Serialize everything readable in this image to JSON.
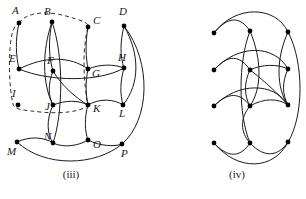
{
  "figure": {
    "background": "#ffffff",
    "stroke": "#1a1a1a",
    "vertex_fill": "#000000",
    "width": 306,
    "height": 199
  },
  "panels": [
    {
      "id": "iii",
      "caption": "(iii)",
      "caption_x": 70,
      "caption_y": 170,
      "labelled": true,
      "has_dashed_overlay": true,
      "vertices": [
        {
          "id": "A",
          "label": "A",
          "x": 19,
          "y": 23,
          "lx": 12,
          "ly": 14
        },
        {
          "id": "B",
          "label": "B",
          "x": 52,
          "y": 22,
          "lx": 44,
          "ly": 15
        },
        {
          "id": "C",
          "label": "C",
          "x": 88,
          "y": 27,
          "lx": 93,
          "ly": 24
        },
        {
          "id": "D",
          "label": "D",
          "x": 124,
          "y": 26,
          "lx": 119,
          "ly": 15
        },
        {
          "id": "E",
          "label": "E",
          "x": 19,
          "y": 69,
          "lx": 9,
          "ly": 62
        },
        {
          "id": "F",
          "label": "F",
          "x": 53,
          "y": 71,
          "lx": 47,
          "ly": 64
        },
        {
          "id": "G",
          "label": "G",
          "x": 88,
          "y": 69,
          "lx": 92,
          "ly": 77
        },
        {
          "id": "H",
          "label": "H",
          "x": 124,
          "y": 68,
          "lx": 118,
          "ly": 61
        },
        {
          "id": "I",
          "label": "I",
          "x": 18,
          "y": 105,
          "lx": 12,
          "ly": 97
        },
        {
          "id": "J",
          "label": "J",
          "x": 53,
          "y": 105,
          "lx": 45,
          "ly": 110
        },
        {
          "id": "K",
          "label": "K",
          "x": 88,
          "y": 105,
          "lx": 93,
          "ly": 112
        },
        {
          "id": "L",
          "label": "L",
          "x": 123,
          "y": 105,
          "lx": 119,
          "ly": 117
        },
        {
          "id": "M",
          "label": "M",
          "x": 17,
          "y": 142,
          "lx": 7,
          "ly": 155
        },
        {
          "id": "N",
          "label": "N",
          "x": 53,
          "y": 143,
          "lx": 44,
          "ly": 140
        },
        {
          "id": "O",
          "label": "O",
          "x": 88,
          "y": 140,
          "lx": 93,
          "ly": 148
        },
        {
          "id": "P",
          "label": "P",
          "x": 122,
          "y": 144,
          "lx": 121,
          "ly": 157
        }
      ],
      "edges": [
        {
          "from": "A",
          "to": "E"
        },
        {
          "from": "B",
          "to": "F"
        },
        {
          "from": "B",
          "to": "N"
        },
        {
          "from": "B",
          "to": "J"
        },
        {
          "from": "C",
          "to": "G"
        },
        {
          "from": "D",
          "to": "H"
        },
        {
          "from": "D",
          "to": "P"
        },
        {
          "from": "D",
          "to": "L"
        },
        {
          "from": "E",
          "to": "G"
        },
        {
          "from": "E",
          "to": "H"
        },
        {
          "from": "F",
          "to": "J"
        },
        {
          "from": "F",
          "to": "K"
        },
        {
          "from": "G",
          "to": "K"
        },
        {
          "from": "G",
          "to": "H"
        },
        {
          "from": "H",
          "to": "L"
        },
        {
          "from": "J",
          "to": "N"
        },
        {
          "from": "J",
          "to": "K"
        },
        {
          "from": "K",
          "to": "L"
        },
        {
          "from": "K",
          "to": "O"
        },
        {
          "from": "M",
          "to": "N"
        },
        {
          "from": "M",
          "to": "O"
        },
        {
          "from": "N",
          "to": "O"
        },
        {
          "from": "O",
          "to": "P"
        },
        {
          "from": "M",
          "to": "P"
        }
      ]
    },
    {
      "id": "iv",
      "caption": "(iv)",
      "caption_x": 236,
      "caption_y": 170,
      "labelled": false,
      "has_dashed_overlay": false,
      "vertices": [
        {
          "id": "a",
          "x": 214,
          "y": 33
        },
        {
          "id": "b",
          "x": 250,
          "y": 31
        },
        {
          "id": "c",
          "x": 288,
          "y": 32
        },
        {
          "id": "d",
          "x": 214,
          "y": 70
        },
        {
          "id": "e",
          "x": 250,
          "y": 70
        },
        {
          "id": "f",
          "x": 288,
          "y": 69
        },
        {
          "id": "g",
          "x": 214,
          "y": 106
        },
        {
          "id": "h",
          "x": 250,
          "y": 106
        },
        {
          "id": "i",
          "x": 288,
          "y": 105
        },
        {
          "id": "j",
          "x": 214,
          "y": 143
        },
        {
          "id": "k",
          "x": 250,
          "y": 143
        },
        {
          "id": "l",
          "x": 288,
          "y": 142
        }
      ],
      "edges": [
        {
          "from": "a",
          "to": "b"
        },
        {
          "from": "a",
          "to": "c"
        },
        {
          "from": "b",
          "to": "h"
        },
        {
          "from": "b",
          "to": "k"
        },
        {
          "from": "c",
          "to": "i"
        },
        {
          "from": "c",
          "to": "l"
        },
        {
          "from": "d",
          "to": "e"
        },
        {
          "from": "d",
          "to": "f"
        },
        {
          "from": "e",
          "to": "h"
        },
        {
          "from": "e",
          "to": "f"
        },
        {
          "from": "e",
          "to": "i"
        },
        {
          "from": "f",
          "to": "i"
        },
        {
          "from": "g",
          "to": "h"
        },
        {
          "from": "g",
          "to": "i"
        },
        {
          "from": "h",
          "to": "k"
        },
        {
          "from": "h",
          "to": "i"
        },
        {
          "from": "j",
          "to": "k"
        },
        {
          "from": "j",
          "to": "l"
        },
        {
          "from": "k",
          "to": "l"
        }
      ]
    }
  ]
}
